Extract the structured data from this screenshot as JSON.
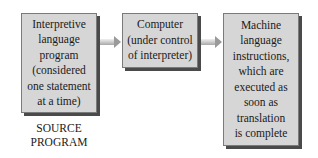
{
  "diagram": {
    "type": "flow",
    "nodes": [
      {
        "id": "source",
        "text": "Interpretive\nlanguage\nprogram\n(considered\none statement\nat a time)"
      },
      {
        "id": "computer",
        "text": "Computer\n(under control\nof interpreter)"
      },
      {
        "id": "machine",
        "text": "Machine\nlanguage\ninstructions,\nwhich are\nexecuted as\nsoon as\ntranslation\nis complete"
      }
    ],
    "edges": [
      {
        "from": "source",
        "to": "computer"
      },
      {
        "from": "computer",
        "to": "machine"
      }
    ],
    "labels": {
      "source_caption": "SOURCE\nPROGRAM"
    },
    "colors": {
      "box_fill": "#d6d6d6",
      "box_shadow": "#4a4a4a",
      "arrow": "#a8a8a8"
    }
  }
}
